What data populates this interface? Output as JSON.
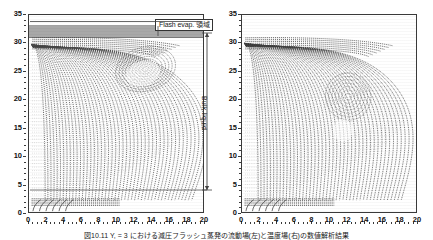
{
  "figure": {
    "caption": "図10.11  Y, = 3 における減圧フラッシュ蒸発の流動場(左)と温度場(右)の数値解析結果",
    "panels": [
      {
        "id": "left",
        "name": "flow-field-plot",
        "x_axis": {
          "label": "",
          "min": 0,
          "max": 20,
          "ticks": [
            0,
            2,
            4,
            6,
            8,
            10,
            12,
            14,
            16,
            18,
            20
          ],
          "minor_step": 0.5
        },
        "y_axis": {
          "label": "",
          "min": 0,
          "max": 35,
          "ticks": [
            0,
            5,
            10,
            15,
            20,
            25,
            30,
            35
          ],
          "minor_step": 1
        },
        "evaporation_band": {
          "y_top": 33.2,
          "y_bottom": 31.2,
          "color": "#a8a8a8"
        },
        "annotations": [
          {
            "name": "flash-evap-region-label",
            "text": "Flash evap. 領域"
          },
          {
            "name": "bulk-liquid-label",
            "text": "Bulk liquid"
          }
        ]
      },
      {
        "id": "right",
        "name": "temperature-field-plot",
        "x_axis": {
          "label": "",
          "min": 0,
          "max": 20,
          "ticks": [
            0,
            2,
            4,
            6,
            8,
            10,
            12,
            14,
            16,
            18,
            20
          ],
          "minor_step": 0.5
        },
        "y_axis": {
          "label": "",
          "min": 0,
          "max": 35,
          "ticks": [
            0,
            5,
            10,
            15,
            20,
            25,
            30,
            35
          ],
          "minor_step": 1
        },
        "annotations": []
      }
    ]
  },
  "chart_data": [
    {
      "type": "line",
      "title": "Flash evaporation flow field (left panel)",
      "xlabel": "",
      "ylabel": "",
      "xlim": [
        0,
        20
      ],
      "ylim": [
        0,
        35
      ],
      "grid": false,
      "legend": "none",
      "annotations": [
        {
          "text": "Flash evap. 領域",
          "x": 17.5,
          "y": 33.5
        },
        {
          "text": "Bulk liquid",
          "x": 20.6,
          "y": 17
        }
      ],
      "shaded_regions": [
        {
          "name": "flash-evap-band",
          "y0": 31.2,
          "y1": 33.2,
          "x0": 0,
          "x1": 20,
          "color": "#a8a8a8"
        }
      ],
      "description": "Dense family of vertical streamlines rising from the bottom wall, turning over near y=31 and converging into a rounded plume boundary that bulges out to x≈18 near y=26 and narrows toward x≈10 at y=2.",
      "series": [
        {
          "name": "plume-outer-boundary",
          "x": [
            0.3,
            2.0,
            5.0,
            8.0,
            10.5,
            13.0,
            15.5,
            17.2,
            18.0,
            17.8,
            16.5,
            14.0,
            11.5,
            10.2,
            10.0
          ],
          "y": [
            31.0,
            31.1,
            31.1,
            31.0,
            30.8,
            30.2,
            29.0,
            27.2,
            24.5,
            20.0,
            14.5,
            9.0,
            5.0,
            3.0,
            2.2
          ]
        },
        {
          "name": "recirculation-core",
          "x": [
            10.0,
            12.0,
            13.5,
            13.0,
            11.0,
            9.5,
            10.0
          ],
          "y": [
            22.0,
            23.5,
            21.0,
            17.5,
            16.0,
            19.0,
            22.0
          ]
        },
        {
          "name": "bottom-wall-jet",
          "x": [
            0.2,
            1.0,
            2.5,
            4.5,
            7.0,
            9.0,
            10.3
          ],
          "y": [
            2.4,
            2.3,
            2.3,
            2.4,
            2.5,
            2.4,
            2.3
          ]
        }
      ]
    },
    {
      "type": "line",
      "title": "Flash evaporation temperature / vector field (right panel)",
      "xlabel": "",
      "ylabel": "",
      "xlim": [
        0,
        20
      ],
      "ylim": [
        0,
        35
      ],
      "grid": false,
      "legend": "none",
      "annotations": [],
      "shaded_regions": [],
      "description": "Dense vector/contour field: near-vertical lines at the left wall, a mottled high-gradient cell centred near x≈13, y≈25, and curved contours sweeping down-right to x≈18 at y≈4.",
      "series": [
        {
          "name": "plume-outer-boundary",
          "x": [
            0.3,
            2.0,
            5.0,
            8.0,
            11.0,
            14.0,
            16.5,
            18.0,
            18.2,
            17.0,
            14.5,
            12.0,
            10.5,
            10.2
          ],
          "y": [
            30.8,
            31.0,
            31.0,
            30.9,
            30.6,
            29.8,
            28.0,
            25.0,
            20.0,
            13.5,
            8.0,
            4.5,
            2.8,
            2.2
          ]
        },
        {
          "name": "vortex-cell",
          "x": [
            11.0,
            13.0,
            15.0,
            15.5,
            14.0,
            12.0,
            11.0
          ],
          "y": [
            26.5,
            28.0,
            26.5,
            23.5,
            21.5,
            23.0,
            26.5
          ]
        },
        {
          "name": "bottom-wall-jet",
          "x": [
            0.2,
            1.2,
            3.0,
            5.5,
            8.0,
            10.0,
            10.4
          ],
          "y": [
            2.5,
            2.4,
            2.4,
            2.5,
            2.5,
            2.4,
            2.3
          ]
        }
      ]
    }
  ]
}
